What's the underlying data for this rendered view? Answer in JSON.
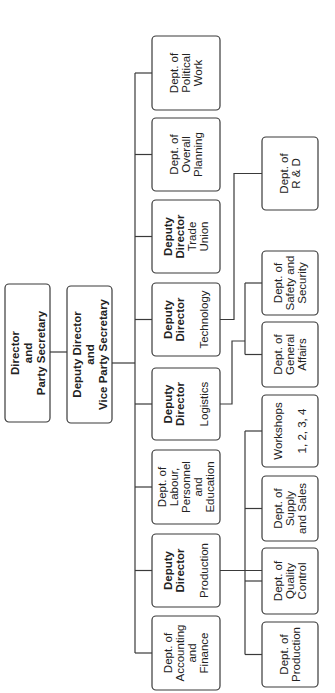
{
  "diagram": {
    "type": "org-chart",
    "orientation": "rotated-90-counterclockwise",
    "nodes": [
      {
        "id": "director",
        "lines": [
          {
            "text": "Director",
            "bold": true
          },
          {
            "text": "and",
            "bold": true
          },
          {
            "text": "Party Secretary",
            "bold": true
          }
        ]
      },
      {
        "id": "deputy-director-vps",
        "lines": [
          {
            "text": "Deputy Director",
            "bold": true
          },
          {
            "text": "and",
            "bold": true
          },
          {
            "text": "Vice Party Secretary",
            "bold": true
          }
        ]
      },
      {
        "id": "dept-political-work",
        "lines": [
          {
            "text": "Dept. of",
            "bold": false
          },
          {
            "text": "Political",
            "bold": false
          },
          {
            "text": "Work",
            "bold": false
          }
        ]
      },
      {
        "id": "dept-overall-planning",
        "lines": [
          {
            "text": "Dept. of",
            "bold": false
          },
          {
            "text": "Overall",
            "bold": false
          },
          {
            "text": "Planning",
            "bold": false
          }
        ]
      },
      {
        "id": "dd-trade-union",
        "lines": [
          {
            "text": "Deputy",
            "bold": true
          },
          {
            "text": "Director",
            "bold": true
          },
          {
            "text": "Trade",
            "bold": false
          },
          {
            "text": "Union",
            "bold": false
          }
        ]
      },
      {
        "id": "dd-technology",
        "lines": [
          {
            "text": "Deputy",
            "bold": true
          },
          {
            "text": "Director",
            "bold": true
          },
          {
            "text": "",
            "bold": false
          },
          {
            "text": "Technology",
            "bold": false
          }
        ]
      },
      {
        "id": "dd-logistics",
        "lines": [
          {
            "text": "Deputy",
            "bold": true
          },
          {
            "text": "Director",
            "bold": true
          },
          {
            "text": "",
            "bold": false
          },
          {
            "text": "Logistics",
            "bold": false
          }
        ]
      },
      {
        "id": "dept-labour",
        "lines": [
          {
            "text": "Dept. of",
            "bold": false
          },
          {
            "text": "Labour,",
            "bold": false
          },
          {
            "text": "Personnel",
            "bold": false
          },
          {
            "text": "and",
            "bold": false
          },
          {
            "text": "Education",
            "bold": false
          }
        ]
      },
      {
        "id": "dd-production",
        "lines": [
          {
            "text": "Deputy",
            "bold": true
          },
          {
            "text": "Director",
            "bold": true
          },
          {
            "text": "",
            "bold": false
          },
          {
            "text": "Production",
            "bold": false
          }
        ]
      },
      {
        "id": "dept-accounting",
        "lines": [
          {
            "text": "Dept. of",
            "bold": false
          },
          {
            "text": "Accounting",
            "bold": false
          },
          {
            "text": "and",
            "bold": false
          },
          {
            "text": "Finance",
            "bold": false
          }
        ]
      },
      {
        "id": "dept-rd",
        "lines": [
          {
            "text": "Dept. of",
            "bold": false
          },
          {
            "text": "R & D",
            "bold": false
          }
        ]
      },
      {
        "id": "dept-safety",
        "lines": [
          {
            "text": "Dept. of",
            "bold": false
          },
          {
            "text": "Safety and",
            "bold": false
          },
          {
            "text": "Security",
            "bold": false
          }
        ]
      },
      {
        "id": "dept-general-affairs",
        "lines": [
          {
            "text": "Dept. of",
            "bold": false
          },
          {
            "text": "General",
            "bold": false
          },
          {
            "text": "Affairs",
            "bold": false
          }
        ]
      },
      {
        "id": "workshops",
        "lines": [
          {
            "text": "Workshops",
            "bold": false
          },
          {
            "text": "",
            "bold": false
          },
          {
            "text": "1, 2, 3, 4",
            "bold": false
          }
        ]
      },
      {
        "id": "dept-supply-sales",
        "lines": [
          {
            "text": "Dept. of",
            "bold": false
          },
          {
            "text": "Supply",
            "bold": false
          },
          {
            "text": "and Sales",
            "bold": false
          }
        ]
      },
      {
        "id": "dept-quality-control",
        "lines": [
          {
            "text": "Dept. of",
            "bold": false
          },
          {
            "text": "Quality",
            "bold": false
          },
          {
            "text": "Control",
            "bold": false
          }
        ]
      },
      {
        "id": "dept-production",
        "lines": [
          {
            "text": "Dept. of",
            "bold": false
          },
          {
            "text": "Production",
            "bold": false
          }
        ]
      }
    ],
    "edges": [
      [
        "director",
        "deputy-director-vps"
      ],
      [
        "deputy-director-vps",
        "dept-political-work"
      ],
      [
        "deputy-director-vps",
        "dept-overall-planning"
      ],
      [
        "deputy-director-vps",
        "dd-trade-union"
      ],
      [
        "deputy-director-vps",
        "dd-technology"
      ],
      [
        "deputy-director-vps",
        "dd-logistics"
      ],
      [
        "deputy-director-vps",
        "dept-labour"
      ],
      [
        "deputy-director-vps",
        "dd-production"
      ],
      [
        "deputy-director-vps",
        "dept-accounting"
      ],
      [
        "dd-technology",
        "dept-rd"
      ],
      [
        "dd-logistics",
        "dept-safety"
      ],
      [
        "dd-logistics",
        "dept-general-affairs"
      ],
      [
        "dd-production",
        "workshops"
      ],
      [
        "dd-production",
        "dept-supply-sales"
      ],
      [
        "dd-production",
        "dept-quality-control"
      ],
      [
        "dd-production",
        "dept-production"
      ]
    ]
  }
}
